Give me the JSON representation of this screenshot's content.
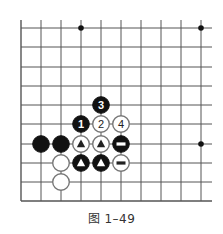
{
  "caption": "图 1–49",
  "board": {
    "x_lines": [
      21,
      41,
      61,
      81,
      101,
      121,
      141,
      161,
      181,
      201
    ],
    "y_lines": [
      28,
      47,
      67,
      86,
      105,
      124,
      144,
      163,
      182,
      201
    ],
    "open_top_y": 20,
    "open_right_x": 212,
    "line_color": "#555555",
    "star_points": [
      [
        3,
        0
      ],
      [
        9,
        0
      ],
      [
        9,
        6
      ]
    ]
  },
  "stones": [
    {
      "col": 3,
      "row": 5,
      "color": "black",
      "mark": "1"
    },
    {
      "col": 4,
      "row": 5,
      "color": "white",
      "mark": "2"
    },
    {
      "col": 4,
      "row": 4,
      "color": "black",
      "mark": "3"
    },
    {
      "col": 5,
      "row": 5,
      "color": "white",
      "mark": "4"
    },
    {
      "col": 1,
      "row": 6,
      "color": "black",
      "mark": ""
    },
    {
      "col": 2,
      "row": 6,
      "color": "black",
      "mark": ""
    },
    {
      "col": 3,
      "row": 6,
      "color": "white",
      "mark": "triangle"
    },
    {
      "col": 4,
      "row": 6,
      "color": "white",
      "mark": "triangle"
    },
    {
      "col": 5,
      "row": 6,
      "color": "black",
      "mark": "bar"
    },
    {
      "col": 2,
      "row": 7,
      "color": "white",
      "mark": ""
    },
    {
      "col": 3,
      "row": 7,
      "color": "black",
      "mark": "triangle"
    },
    {
      "col": 4,
      "row": 7,
      "color": "black",
      "mark": "triangle"
    },
    {
      "col": 5,
      "row": 7,
      "color": "white",
      "mark": "bar"
    },
    {
      "col": 2,
      "row": 8,
      "color": "white",
      "mark": ""
    }
  ]
}
